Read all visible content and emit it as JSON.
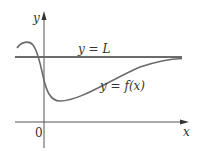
{
  "figure": {
    "axes": {
      "y_label": "y",
      "x_label": "x",
      "origin_label": "0"
    },
    "asymptote": {
      "label": "y = L",
      "color": "#6b6b6b"
    },
    "curve": {
      "label": "y = f(x)",
      "color": "#6b6b6b"
    },
    "axis_color": "#555555"
  }
}
